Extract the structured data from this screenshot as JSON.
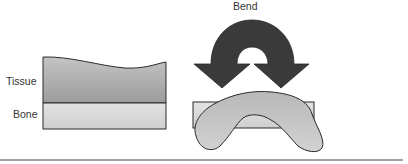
{
  "labels": {
    "tissue": "Tissue",
    "bone": "Bone",
    "bend": "Bend"
  },
  "colors": {
    "tissue_fill_top": "#bdbdbd",
    "tissue_fill_bottom": "#9a9a9a",
    "bone_fill": "#dcdcdc",
    "arrow_fill": "#3a3a3a",
    "outline": "#2a2a2a",
    "baseline": "#444444"
  }
}
